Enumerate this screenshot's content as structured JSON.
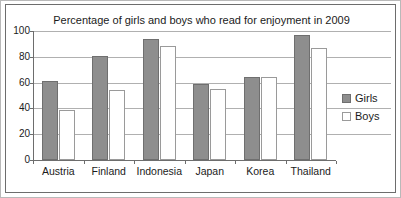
{
  "chart_data": {
    "type": "bar",
    "title": "Percentage of girls and boys who read for enjoyment in 2009",
    "xlabel": "",
    "ylabel": "",
    "categories": [
      "Austria",
      "Finland",
      "Indonesia",
      "Japan",
      "Korea",
      "Thailand"
    ],
    "series": [
      {
        "name": "Girls",
        "values": [
          61,
          81,
          94,
          59,
          64,
          97
        ],
        "color": "#8e8e8e"
      },
      {
        "name": "Boys",
        "values": [
          39,
          54,
          88,
          55,
          64,
          87
        ],
        "color": "#ffffff"
      }
    ],
    "ylim": [
      0,
      100
    ],
    "yticks": [
      0,
      20,
      40,
      60,
      80,
      100
    ],
    "ytick_labels": [
      "0",
      "20",
      "40",
      "60",
      "80",
      "100"
    ],
    "grid": true,
    "legend_position": "right"
  },
  "legend": {
    "entries": [
      {
        "label": "Girls"
      },
      {
        "label": "Boys"
      }
    ]
  }
}
